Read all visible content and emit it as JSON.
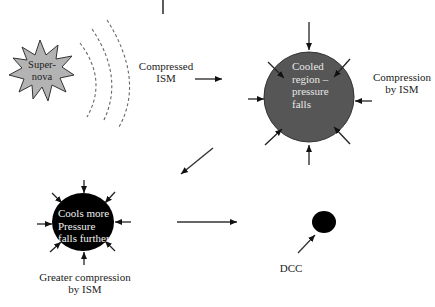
{
  "diagram": {
    "nodes": {
      "supernova": {
        "label": "Super-\nnova",
        "line1": "Super-",
        "line2": "nova",
        "fill": "#b3b3b3"
      },
      "compressed_ism": {
        "line1": "Compressed",
        "line2": "ISM"
      },
      "cooled_region": {
        "line1": "Cooled",
        "line2": "region –",
        "line3": "pressure",
        "line4": "falls",
        "fill": "#565656"
      },
      "compression_by_ism": {
        "line1": "Compression",
        "line2": "by ISM"
      },
      "cools_more": {
        "line1": "Cools more",
        "line2": "Pressure",
        "line3": "falls further",
        "fill": "#000000"
      },
      "greater_compression": {
        "line1": "Greater compression",
        "line2": "by ISM"
      },
      "dcc": {
        "label": "DCC",
        "fill": "#000000"
      }
    },
    "edges": [
      {
        "from": "compressed_ism",
        "to": "cooled_region"
      },
      {
        "from": "cooled_region",
        "to": "cools_more"
      },
      {
        "from": "cools_more",
        "to": "dcc"
      }
    ]
  }
}
